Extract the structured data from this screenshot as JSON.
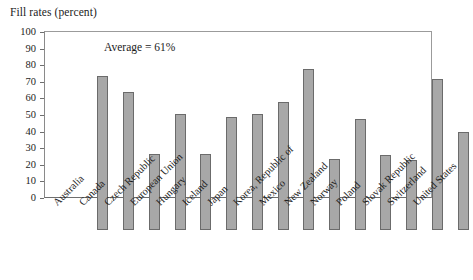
{
  "chart_data": {
    "type": "bar",
    "title": "Fill rates (percent)",
    "xlabel": "",
    "ylabel": "",
    "ylim": [
      0,
      100
    ],
    "yticks": [
      0,
      10,
      20,
      30,
      40,
      50,
      60,
      70,
      80,
      90,
      100
    ],
    "grid": false,
    "legend": null,
    "annotations": [
      {
        "text": "Average = 61%",
        "value": 61
      }
    ],
    "categories": [
      "Australia",
      "Canada",
      "Czech Republic",
      "European Union",
      "Hungary",
      "Iceland",
      "Japan",
      "Korea, Republic of",
      "Mexico",
      "New Zealand",
      "Norway",
      "Poland",
      "Slovak Republic",
      "Switzerland",
      "United States"
    ],
    "values": [
      93,
      83,
      46,
      70,
      46,
      68,
      70,
      77,
      97,
      43,
      67,
      45,
      42,
      91,
      59
    ],
    "bar_color": "#a8a8a8",
    "bar_edge_color": "#6b6b6b",
    "axis_color": "#6e6e6e"
  }
}
